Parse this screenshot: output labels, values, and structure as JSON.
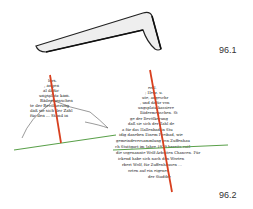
{
  "figure": {
    "panel_1": {
      "label": "96.1",
      "description": "bent bar / angled ruler shape"
    },
    "panel_2": {
      "label": "96.2",
      "description": "text distorted into triangular shapes with red axis line and green base line"
    }
  },
  "colors": {
    "red_line": "#d8401f",
    "green_line": "#5aa04a",
    "shape_fill": "#eeeeee",
    "shape_stroke": "#222222",
    "text": "#222222"
  },
  "left_text_lines": [
    "lers.",
    ", angen",
    "al dafür",
    "ungsplatz kam.",
    "Bädermenschen",
    "te der Bevölkerung",
    "daß sie sich der Zahl",
    "für den ... Stand in"
  ],
  "right_text_lines": [
    "erkl.",
    "; Herz. u.",
    "ute, angeschr",
    ", und dafür von",
    "ungsplatz kassiere",
    "Bädermenschen. St",
    "ge der Bevölkerung",
    "daß sie sich der Zahl de",
    "a für das Hallenbad in Stu",
    "idig daneben Einem Freibad, wie",
    "gemeindeversammlung von Zuffenhau",
    "ch Stuttgart im Jahre 1929 bereits entl",
    "die sogenannte Wolf-Arbeiten Chancen. Für",
    "ickend habe sich nach den Worten",
    "rbert Wolf, für Zuffenhausen ...",
    "orten auf ein eigenes",
    "der Stadtbe"
  ]
}
